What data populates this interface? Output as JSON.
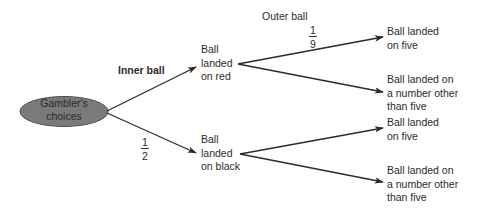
{
  "diagram": {
    "type": "probability-tree",
    "colors": {
      "root_fill": "#7a7a7a",
      "root_stroke": "#4a4a4a",
      "line": "#2b2b2b",
      "text": "#2b2b2b"
    },
    "root": {
      "label_line1": "Gambler's",
      "label_line2": "choices"
    },
    "stage_labels": {
      "inner": "Inner ball",
      "outer": "Outer ball"
    },
    "probabilities": {
      "black_branch": {
        "numerator": "1",
        "denominator": "2"
      },
      "red_five_branch": {
        "numerator": "1",
        "denominator": "9"
      }
    },
    "level1": [
      {
        "line1": "Ball",
        "line2": "landed",
        "line3": "on red"
      },
      {
        "line1": "Ball",
        "line2": "landed",
        "line3": "on black"
      }
    ],
    "level2": [
      {
        "line1": "Ball landed",
        "line2": "on five"
      },
      {
        "line1": "Ball landed on",
        "line2": "a number other",
        "line3": "than five"
      },
      {
        "line1": "Ball landed",
        "line2": "on five"
      },
      {
        "line1": "Ball landed on",
        "line2": "a number other",
        "line3": "than five"
      }
    ]
  }
}
